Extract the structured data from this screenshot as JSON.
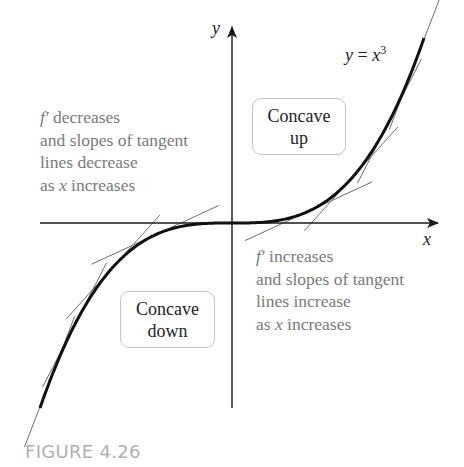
{
  "figure": {
    "caption": "FIGURE 4.26",
    "function_label": {
      "lhs": "y",
      "eq": " = ",
      "base": "x",
      "exp": "3"
    },
    "axes": {
      "x_label": "x",
      "y_label": "y"
    },
    "regions": {
      "concave_up": {
        "line1": "Concave",
        "line2": "up"
      },
      "concave_down": {
        "line1": "Concave",
        "line2": "down"
      }
    },
    "notes": {
      "left": {
        "prime": "f′",
        "line1": " decreases",
        "line2": "and slopes of tangent",
        "line3": "lines decrease",
        "line4_pre": "as ",
        "line4_var": "x",
        "line4_post": " increases"
      },
      "right": {
        "prime": "f′",
        "line1": " increases",
        "line2": "and slopes of tangent",
        "line3": "lines increase",
        "line4_pre": "as ",
        "line4_var": "x",
        "line4_post": " increases"
      }
    },
    "colors": {
      "curve": "#111111",
      "axes": "#1a1a1a",
      "tangent": "#6e6e6e",
      "note_text": "#7a7a7a",
      "box_border": "#c4c4c4",
      "caption": "#b0b0b0"
    }
  },
  "chart_data": {
    "type": "line",
    "xlabel": "x",
    "ylabel": "y",
    "series": [
      {
        "name": "y = x^3",
        "x": [
          -1.0,
          -0.75,
          -0.5,
          -0.25,
          0,
          0.25,
          0.5,
          0.75,
          1.0
        ],
        "values": [
          -1.0,
          -0.42,
          -0.125,
          -0.016,
          0,
          0.016,
          0.125,
          0.42,
          1.0
        ]
      }
    ],
    "tangent_points_x": [
      -0.95,
      -0.82,
      -0.62,
      -0.4,
      0.4,
      0.62,
      0.82,
      0.95
    ],
    "annotations": [
      "Concave up (x > 0)",
      "Concave down (x < 0)",
      "f' decreases and slopes of tangent lines decrease as x increases",
      "f' increases and slopes of tangent lines increase as x increases"
    ],
    "grid": false
  }
}
